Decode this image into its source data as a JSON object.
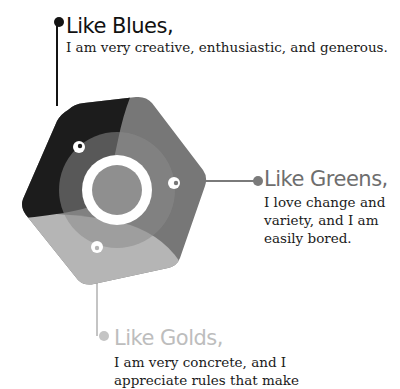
{
  "items": [
    {
      "title": "Like Blues,",
      "text": "I am very creative, enthusiastic, and generous.",
      "color": "#141414"
    },
    {
      "title": "Like Greens,",
      "text": "I love change and variety, and I am easily bored.",
      "color": "#6e6e6e"
    },
    {
      "title": "Like Golds,",
      "text": "I am very concrete, and I appreciate rules that make",
      "color": "#c4c4c4"
    }
  ],
  "colors": {
    "blue_segment": "#1c1c1c",
    "green_segment": "#777777",
    "gold_segment": "#b8b8b8",
    "inner_ring": "#8a8a8a",
    "center": "#8f8f8f",
    "ring": "#ffffff"
  }
}
